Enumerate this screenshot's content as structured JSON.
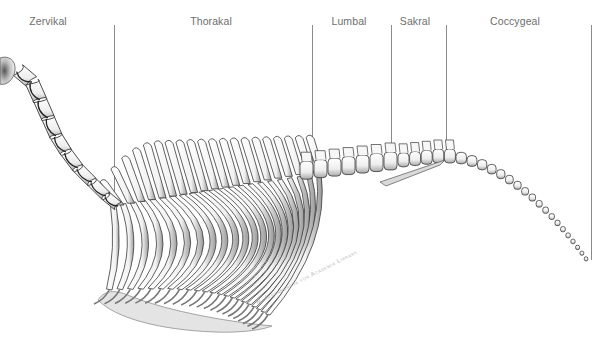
{
  "figure": {
    "regions": [
      {
        "id": "cervical",
        "label": "Zervikal"
      },
      {
        "id": "thoracic",
        "label": "Thorakal"
      },
      {
        "id": "lumbar",
        "label": "Lumbal"
      },
      {
        "id": "sacral",
        "label": "Sakral"
      },
      {
        "id": "coccygeal",
        "label": "Coccygeal"
      }
    ],
    "watermark": "N. Alexandrova for Academia Library",
    "colors": {
      "label_text": "#6e6e6e",
      "divider": "#8a8a8a",
      "bone_outline": "#3a3a3a",
      "bone_fill": "#f4f4f4",
      "bone_shade": "#bdbdbd",
      "sternum_fill": "#e2e2e2"
    }
  }
}
